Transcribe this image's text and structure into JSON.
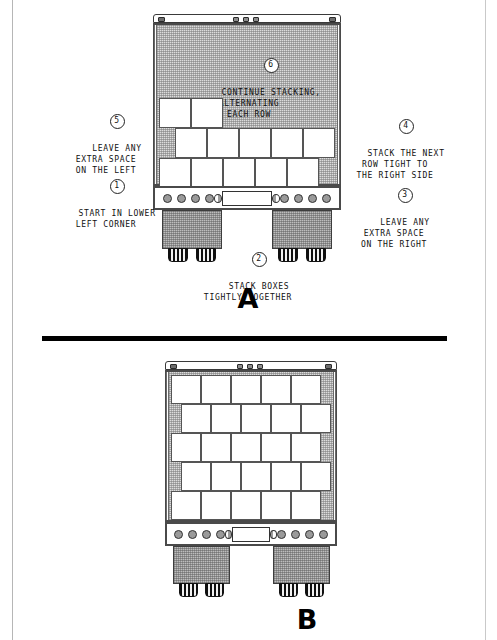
{
  "document": {
    "title": "Box Stacking Loading Instructions",
    "panels": [
      {
        "id": "A",
        "letter": "A",
        "caption": "Partially loaded trailer"
      },
      {
        "id": "B",
        "letter": "B",
        "caption": "Fully loaded trailer"
      }
    ]
  },
  "callouts": [
    {
      "number": "1",
      "badge": "1",
      "text": "START IN LOWER\nLEFT CORNER",
      "position": "left-lower"
    },
    {
      "number": "2",
      "badge": "2",
      "text": "STACK BOXES\nTIGHTLY TOGETHER",
      "position": "bottom-center"
    },
    {
      "number": "3",
      "badge": "3",
      "text": "LEAVE ANY\nEXTRA SPACE\nON THE RIGHT",
      "position": "right-lower"
    },
    {
      "number": "4",
      "badge": "4",
      "text": "STACK THE NEXT\nROW TIGHT TO\nTHE RIGHT SIDE",
      "position": "right-upper"
    },
    {
      "number": "5",
      "badge": "5",
      "text": "LEAVE ANY\nEXTRA SPACE\nON THE LEFT",
      "position": "left-upper"
    },
    {
      "number": "6",
      "badge": "6",
      "text": "CONTINUE STACKING,\nALTERNATING\nEACH ROW",
      "position": "inside-cargo-top"
    }
  ],
  "truck_a": {
    "rows": [
      {
        "index": 0,
        "align": "tight-left",
        "boxes": 2,
        "gap_side": "right"
      },
      {
        "index": 1,
        "align": "tight-right",
        "boxes": 5,
        "gap_side": "left"
      },
      {
        "index": 2,
        "align": "tight-left",
        "boxes": 5,
        "gap_side": "right"
      }
    ],
    "empty_space_top": true,
    "lamps_per_side": 4,
    "clearance_lights": 3,
    "axles": 2,
    "tires_per_axle": 2
  },
  "truck_b": {
    "rows": [
      {
        "index": 0,
        "align": "tight-left",
        "boxes": 5,
        "gap_side": "right"
      },
      {
        "index": 1,
        "align": "tight-right",
        "boxes": 5,
        "gap_side": "left"
      },
      {
        "index": 2,
        "align": "tight-left",
        "boxes": 5,
        "gap_side": "right"
      },
      {
        "index": 3,
        "align": "tight-right",
        "boxes": 5,
        "gap_side": "left"
      },
      {
        "index": 4,
        "align": "tight-left",
        "boxes": 5,
        "gap_side": "right"
      }
    ],
    "empty_space_top": false,
    "lamps_per_side": 4,
    "clearance_lights": 3,
    "axles": 2,
    "tires_per_axle": 2
  },
  "colors": {
    "cargo_empty": "#dcdcdc",
    "box_fill": "#ffffff",
    "outline": "#4a4a4a",
    "divider": "#000000",
    "axle_fill": "#bdbdbd"
  }
}
